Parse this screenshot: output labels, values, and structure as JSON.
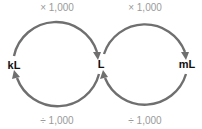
{
  "diagram": {
    "nodes": [
      {
        "id": "kl",
        "label": "kL"
      },
      {
        "id": "l",
        "label": "L"
      },
      {
        "id": "ml",
        "label": "mL"
      }
    ],
    "edges": [
      {
        "from": "kL",
        "to": "L",
        "label": "× 1,000",
        "position": "top-left"
      },
      {
        "from": "L",
        "to": "mL",
        "label": "× 1,000",
        "position": "top-right"
      },
      {
        "from": "L",
        "to": "kL",
        "label": "÷ 1,000",
        "position": "bottom-left"
      },
      {
        "from": "mL",
        "to": "L",
        "label": "÷ 1,000",
        "position": "bottom-right"
      }
    ],
    "colors": {
      "arrow": "#6f6f6f",
      "operation_text": "#9a9a9a",
      "unit_text": "#111111"
    }
  }
}
